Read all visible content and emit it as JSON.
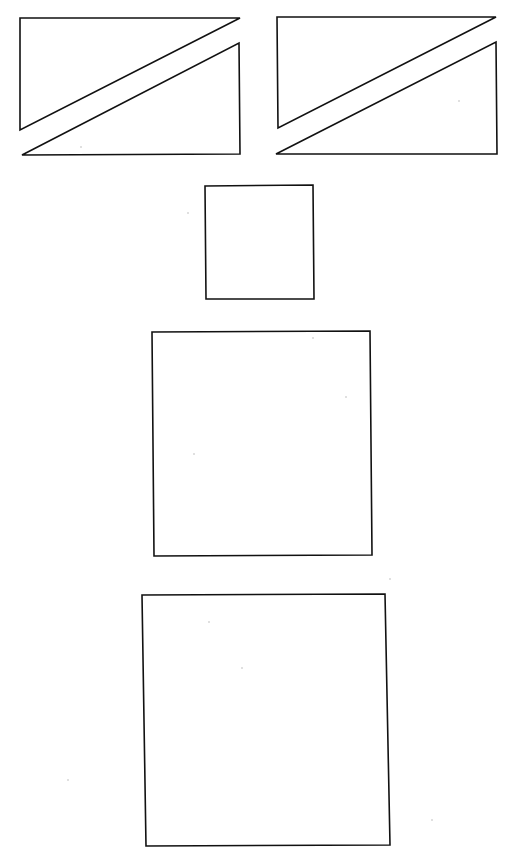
{
  "canvas": {
    "width": 514,
    "height": 861,
    "background": "#ffffff",
    "stroke_color": "#111111"
  },
  "figures": [
    {
      "name": "left-split-rectangle",
      "pieces": [
        {
          "name": "upper-triangle",
          "points": "20,18 240,18 20,130"
        },
        {
          "name": "lower-triangle",
          "points": "22,155 239,43 240,154"
        }
      ]
    },
    {
      "name": "right-split-rectangle",
      "pieces": [
        {
          "name": "upper-triangle",
          "points": "277,17 496,17 278,128"
        },
        {
          "name": "lower-triangle",
          "points": "276,154 496,42 497,154"
        }
      ]
    },
    {
      "name": "small-square",
      "points": "205,186 313,185 314,299 206,299"
    },
    {
      "name": "medium-square",
      "points": "152,332 370,331 372,555 154,556"
    },
    {
      "name": "large-square",
      "points": "142,595 385,594 390,845 146,846"
    }
  ],
  "specks": [
    {
      "cx": 188,
      "cy": 213
    },
    {
      "cx": 313,
      "cy": 338
    },
    {
      "cx": 346,
      "cy": 397
    },
    {
      "cx": 194,
      "cy": 454
    },
    {
      "cx": 209,
      "cy": 622
    },
    {
      "cx": 242,
      "cy": 668
    },
    {
      "cx": 81,
      "cy": 147
    },
    {
      "cx": 459,
      "cy": 101
    },
    {
      "cx": 390,
      "cy": 579
    },
    {
      "cx": 68,
      "cy": 780
    },
    {
      "cx": 432,
      "cy": 820
    }
  ]
}
